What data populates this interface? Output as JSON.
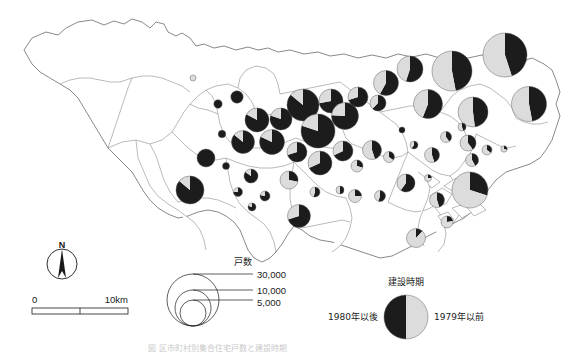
{
  "figure": {
    "title_caption": "図 区市町村別集合住宅戸数と建設時期",
    "region_name": "東京都"
  },
  "legend_size": {
    "header": "戸数",
    "labels": [
      "30,000",
      "10,000",
      "5,000"
    ],
    "values": [
      30000,
      10000,
      5000
    ]
  },
  "legend_period": {
    "header": "建設時期",
    "left_label": "1980年以後",
    "right_label": "1979年以前",
    "left_color": "#1c1c1c",
    "right_color": "#dcdcdc"
  },
  "scalebar": {
    "start_label": "0",
    "end_label": "10km",
    "length_km": 10
  },
  "compass": {
    "label": "N"
  },
  "chart_data": {
    "type": "pie",
    "title": "区市町村別集合住宅戸数と建設時期",
    "categories": [
      "1980年以後",
      "1979年以前"
    ],
    "colors": [
      "#1c1c1c",
      "#dcdcdc"
    ],
    "size_variable": "戸数",
    "size_legend_values": [
      30000,
      10000,
      5000
    ],
    "grid": false,
    "legend_position": "bottom-right",
    "markers": [
      {
        "id": "m01",
        "cx": 193,
        "cy": 78,
        "r": 3.0,
        "new_share": 0.0,
        "old_share": 1.0
      },
      {
        "id": "m02",
        "cx": 218,
        "cy": 104,
        "r": 4.2,
        "new_share": 1.0,
        "old_share": 0.0
      },
      {
        "id": "m03",
        "cx": 237,
        "cy": 97,
        "r": 6.2,
        "new_share": 1.0,
        "old_share": 0.0
      },
      {
        "id": "m04",
        "cx": 252,
        "cy": 122,
        "r": 4.0,
        "new_share": 1.0,
        "old_share": 0.0
      },
      {
        "id": "m05",
        "cx": 222,
        "cy": 134,
        "r": 3.8,
        "new_share": 1.0,
        "old_share": 0.0
      },
      {
        "id": "m06",
        "cx": 257,
        "cy": 120,
        "r": 12.0,
        "new_share": 0.83,
        "old_share": 0.17
      },
      {
        "id": "m07",
        "cx": 281,
        "cy": 119,
        "r": 11.0,
        "new_share": 0.8,
        "old_share": 0.2
      },
      {
        "id": "m08",
        "cx": 243,
        "cy": 142,
        "r": 11.5,
        "new_share": 0.86,
        "old_share": 0.14
      },
      {
        "id": "m09",
        "cx": 272,
        "cy": 142,
        "r": 12.5,
        "new_share": 0.82,
        "old_share": 0.18
      },
      {
        "id": "m10",
        "cx": 303,
        "cy": 105,
        "r": 16.0,
        "new_share": 0.86,
        "old_share": 0.14
      },
      {
        "id": "m11",
        "cx": 331,
        "cy": 101,
        "r": 12.0,
        "new_share": 0.72,
        "old_share": 0.28
      },
      {
        "id": "m12",
        "cx": 318,
        "cy": 131,
        "r": 17.0,
        "new_share": 0.8,
        "old_share": 0.2
      },
      {
        "id": "m13",
        "cx": 345,
        "cy": 116,
        "r": 13.5,
        "new_share": 0.76,
        "old_share": 0.24
      },
      {
        "id": "m14",
        "cx": 358,
        "cy": 97,
        "r": 10.0,
        "new_share": 0.7,
        "old_share": 0.3
      },
      {
        "id": "m15",
        "cx": 378,
        "cy": 103,
        "r": 8.0,
        "new_share": 0.62,
        "old_share": 0.38
      },
      {
        "id": "m16",
        "cx": 386,
        "cy": 83,
        "r": 12.5,
        "new_share": 0.58,
        "old_share": 0.42
      },
      {
        "id": "m17",
        "cx": 410,
        "cy": 69,
        "r": 13.0,
        "new_share": 0.55,
        "old_share": 0.45
      },
      {
        "id": "m18",
        "cx": 428,
        "cy": 104,
        "r": 14.5,
        "new_share": 0.56,
        "old_share": 0.44
      },
      {
        "id": "m19",
        "cx": 452,
        "cy": 71,
        "r": 20.0,
        "new_share": 0.47,
        "old_share": 0.53
      },
      {
        "id": "m20",
        "cx": 473,
        "cy": 112,
        "r": 15.0,
        "new_share": 0.48,
        "old_share": 0.52
      },
      {
        "id": "m21",
        "cx": 505,
        "cy": 55,
        "r": 22.0,
        "new_share": 0.45,
        "old_share": 0.55
      },
      {
        "id": "m22",
        "cx": 529,
        "cy": 104,
        "r": 17.5,
        "new_share": 0.47,
        "old_share": 0.53
      },
      {
        "id": "m23",
        "cx": 468,
        "cy": 143,
        "r": 8.0,
        "new_share": 0.4,
        "old_share": 0.6
      },
      {
        "id": "m24",
        "cx": 487,
        "cy": 150,
        "r": 5.0,
        "new_share": 0.35,
        "old_share": 0.65
      },
      {
        "id": "m25",
        "cx": 504,
        "cy": 149,
        "r": 3.2,
        "new_share": 0.3,
        "old_share": 0.7
      },
      {
        "id": "m26",
        "cx": 472,
        "cy": 160,
        "r": 6.5,
        "new_share": 0.42,
        "old_share": 0.58
      },
      {
        "id": "m27",
        "cx": 462,
        "cy": 127,
        "r": 4.0,
        "new_share": 0.45,
        "old_share": 0.55
      },
      {
        "id": "m28",
        "cx": 446,
        "cy": 137,
        "r": 5.5,
        "new_share": 0.4,
        "old_share": 0.6
      },
      {
        "id": "m29",
        "cx": 432,
        "cy": 155,
        "r": 7.5,
        "new_share": 0.45,
        "old_share": 0.55
      },
      {
        "id": "m30",
        "cx": 414,
        "cy": 145,
        "r": 4.0,
        "new_share": 0.6,
        "old_share": 0.4
      },
      {
        "id": "m31",
        "cx": 402,
        "cy": 130,
        "r": 3.0,
        "new_share": 1.0,
        "old_share": 0.0
      },
      {
        "id": "m32",
        "cx": 389,
        "cy": 157,
        "r": 5.5,
        "new_share": 0.35,
        "old_share": 0.65
      },
      {
        "id": "m33",
        "cx": 372,
        "cy": 150,
        "r": 9.5,
        "new_share": 0.45,
        "old_share": 0.55
      },
      {
        "id": "m34",
        "cx": 357,
        "cy": 166,
        "r": 6.0,
        "new_share": 0.3,
        "old_share": 0.7
      },
      {
        "id": "m35",
        "cx": 343,
        "cy": 151,
        "r": 10.0,
        "new_share": 0.68,
        "old_share": 0.32
      },
      {
        "id": "m36",
        "cx": 320,
        "cy": 163,
        "r": 12.0,
        "new_share": 0.68,
        "old_share": 0.32
      },
      {
        "id": "m37",
        "cx": 297,
        "cy": 152,
        "r": 10.0,
        "new_share": 0.7,
        "old_share": 0.3
      },
      {
        "id": "m38",
        "cx": 289,
        "cy": 180,
        "r": 9.0,
        "new_share": 0.28,
        "old_share": 0.72
      },
      {
        "id": "m39",
        "cx": 315,
        "cy": 192,
        "r": 5.0,
        "new_share": 0.55,
        "old_share": 0.45
      },
      {
        "id": "m40",
        "cx": 340,
        "cy": 190,
        "r": 4.0,
        "new_share": 0.5,
        "old_share": 0.5
      },
      {
        "id": "m41",
        "cx": 355,
        "cy": 196,
        "r": 6.5,
        "new_share": 0.25,
        "old_share": 0.75
      },
      {
        "id": "m42",
        "cx": 380,
        "cy": 196,
        "r": 5.5,
        "new_share": 0.55,
        "old_share": 0.45
      },
      {
        "id": "m43",
        "cx": 406,
        "cy": 183,
        "r": 9.0,
        "new_share": 0.6,
        "old_share": 0.4
      },
      {
        "id": "m44",
        "cx": 437,
        "cy": 200,
        "r": 7.5,
        "new_share": 0.45,
        "old_share": 0.55
      },
      {
        "id": "m45",
        "cx": 447,
        "cy": 222,
        "r": 6.0,
        "new_share": 0.22,
        "old_share": 0.78
      },
      {
        "id": "m46",
        "cx": 470,
        "cy": 190,
        "r": 18.0,
        "new_share": 0.3,
        "old_share": 0.7
      },
      {
        "id": "m47",
        "cx": 428,
        "cy": 178,
        "r": 3.5,
        "new_share": 0.25,
        "old_share": 0.75
      },
      {
        "id": "m48",
        "cx": 299,
        "cy": 216,
        "r": 11.5,
        "new_share": 0.7,
        "old_share": 0.3
      },
      {
        "id": "m49",
        "cx": 416,
        "cy": 238,
        "r": 9.5,
        "new_share": 0.12,
        "old_share": 0.88
      },
      {
        "id": "m50",
        "cx": 226,
        "cy": 166,
        "r": 3.5,
        "new_share": 1.0,
        "old_share": 0.0
      },
      {
        "id": "m51",
        "cx": 206,
        "cy": 158,
        "r": 9.0,
        "new_share": 1.0,
        "old_share": 0.0
      },
      {
        "id": "m52",
        "cx": 190,
        "cy": 190,
        "r": 14.0,
        "new_share": 0.86,
        "old_share": 0.14
      },
      {
        "id": "m53",
        "cx": 251,
        "cy": 176,
        "r": 7.0,
        "new_share": 0.85,
        "old_share": 0.15
      },
      {
        "id": "m54",
        "cx": 265,
        "cy": 196,
        "r": 5.0,
        "new_share": 0.78,
        "old_share": 0.22
      },
      {
        "id": "m55",
        "cx": 252,
        "cy": 207,
        "r": 4.0,
        "new_share": 0.8,
        "old_share": 0.2
      },
      {
        "id": "m56",
        "cx": 238,
        "cy": 192,
        "r": 4.5,
        "new_share": 0.75,
        "old_share": 0.25
      }
    ]
  }
}
